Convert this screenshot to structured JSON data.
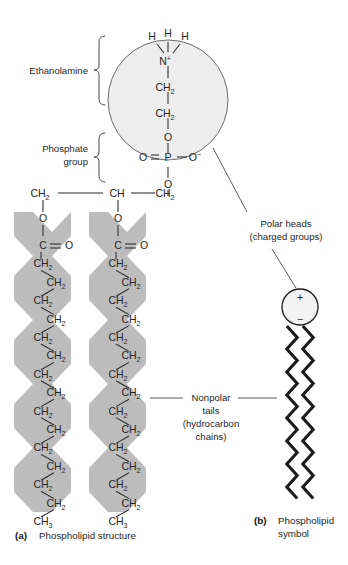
{
  "figure": {
    "panel_a": {
      "marker": "(a)",
      "caption": "Phospholipid structure",
      "brackets": [
        {
          "label": "Ethanolamine",
          "lines": [
            "Ethanolamine"
          ]
        },
        {
          "label": "Phosphate group",
          "lines": [
            "Phosphate",
            "group"
          ]
        }
      ],
      "head_group": {
        "hydrogens": [
          "H",
          "H",
          "H"
        ],
        "nitrogen": "N",
        "nitrogen_charge": "+",
        "methylenes": [
          "CH",
          "CH"
        ],
        "methylene_sub": "2",
        "ester_oxygen": "O",
        "phosphorus": "P",
        "phosphate_double_bond_oxygen": "O",
        "phosphate_anion_oxygen": "O",
        "phosphate_anion_charge": "−",
        "phosphate_lower_oxygen": "O"
      },
      "glycerol_backbone": {
        "left": "CH",
        "left_sub": "2",
        "middle": "CH",
        "middle_sub": "",
        "right": "CH",
        "right_sub": "2"
      },
      "fatty_acid_chains": [
        {
          "name": "chain-1",
          "ester_oxygen": "O",
          "carbonyl_carbon": "C",
          "carbonyl_oxygen": "O",
          "methylene_label": "CH",
          "methylene_sub": "2",
          "methylene_count": 14,
          "terminal_label": "CH",
          "terminal_sub": "3"
        },
        {
          "name": "chain-2",
          "ester_oxygen": "O",
          "carbonyl_carbon": "C",
          "carbonyl_oxygen": "O",
          "methylene_label": "CH",
          "methylene_sub": "2",
          "methylene_count": 14,
          "terminal_label": "CH",
          "terminal_sub": "3"
        }
      ]
    },
    "panel_b": {
      "marker": "(b)",
      "caption_lines": [
        "Phospholipid",
        "symbol"
      ],
      "symbol": {
        "positive_charge": "+",
        "negative_charge": "−",
        "tail_count": 2
      }
    },
    "annotations": [
      {
        "name": "polar-heads",
        "lines": [
          "Polar heads",
          "(charged groups)"
        ]
      },
      {
        "name": "nonpolar-tails",
        "lines": [
          "Nonpolar",
          "tails",
          "(hydrocarbon",
          "chains)"
        ]
      }
    ],
    "colors": {
      "shade_gray": "#bcbcbc",
      "head_fill": "#ededed",
      "outline": "#6e6e6e",
      "ink": "#262626",
      "symbol_ink": "#1c1c1c"
    }
  }
}
